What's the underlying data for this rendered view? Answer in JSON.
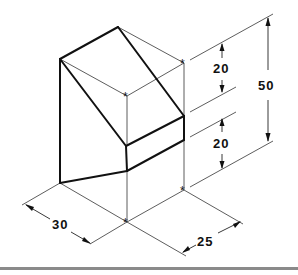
{
  "figure": {
    "type": "isometric-drawing",
    "line_color": "#111111",
    "rule_color": "#8a8a8a"
  },
  "dimensions": {
    "height_total": {
      "label": "50"
    },
    "height_upper": {
      "label": "20"
    },
    "height_lower": {
      "label": "20"
    },
    "width_left": {
      "label": "30"
    },
    "depth_right": {
      "label": "25"
    }
  },
  "markers": {
    "symbol": "*",
    "count": 4
  }
}
